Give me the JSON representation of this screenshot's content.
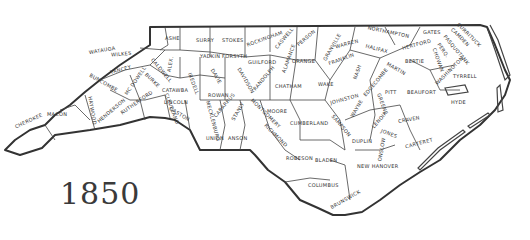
{
  "map": {
    "title_year": "1850",
    "region": "North Carolina",
    "counties": [
      {
        "id": "ashe",
        "name": "ASHE"
      },
      {
        "id": "surry",
        "name": "SURRY"
      },
      {
        "id": "stokes",
        "name": "STOKES"
      },
      {
        "id": "rockingham",
        "name": "ROCKINGHAM"
      },
      {
        "id": "caswell",
        "name": "CASWELL"
      },
      {
        "id": "person",
        "name": "PERSON"
      },
      {
        "id": "granville",
        "name": "GRANVILLE"
      },
      {
        "id": "warren",
        "name": "WARREN"
      },
      {
        "id": "northampton",
        "name": "NORTHAMPTON"
      },
      {
        "id": "gates",
        "name": "GATES"
      },
      {
        "id": "currituck",
        "name": "CURRITUCK"
      },
      {
        "id": "camden",
        "name": "CAMDEN"
      },
      {
        "id": "pasquotank",
        "name": "PASQUOTANK"
      },
      {
        "id": "perquimans",
        "name": "PERQ."
      },
      {
        "id": "chowan",
        "name": "CHOWAN"
      },
      {
        "id": "hertford",
        "name": "HERTFORD"
      },
      {
        "id": "bertie",
        "name": "BERTIE"
      },
      {
        "id": "halifax",
        "name": "HALIFAX"
      },
      {
        "id": "franklin",
        "name": "FRANKLIN"
      },
      {
        "id": "watauga",
        "name": "WATAUGA"
      },
      {
        "id": "wilkes",
        "name": "WILKES"
      },
      {
        "id": "yadkin",
        "name": "YADKIN"
      },
      {
        "id": "forsyth",
        "name": "FORSYTH"
      },
      {
        "id": "guilford",
        "name": "GUILFORD"
      },
      {
        "id": "alamance",
        "name": "ALAMANCE"
      },
      {
        "id": "orange",
        "name": "ORANGE"
      },
      {
        "id": "wake",
        "name": "WAKE"
      },
      {
        "id": "nash",
        "name": "NASH"
      },
      {
        "id": "edgecombe",
        "name": "EDGECOMBE"
      },
      {
        "id": "martin",
        "name": "MARTIN"
      },
      {
        "id": "washington",
        "name": "WASHINGTON"
      },
      {
        "id": "tyrrell",
        "name": "TYRRELL"
      },
      {
        "id": "yancey",
        "name": "YANCEY"
      },
      {
        "id": "caldwell",
        "name": "CALDWELL"
      },
      {
        "id": "alexander",
        "name": "ALEX."
      },
      {
        "id": "iredell",
        "name": "IREDELL"
      },
      {
        "id": "davie",
        "name": "DAVIE"
      },
      {
        "id": "davidson",
        "name": "DAVIDSON"
      },
      {
        "id": "randolph",
        "name": "RANDOLPH"
      },
      {
        "id": "chatham",
        "name": "CHATHAM"
      },
      {
        "id": "johnston",
        "name": "JOHNSTON"
      },
      {
        "id": "wayne",
        "name": "WAYNE"
      },
      {
        "id": "greene",
        "name": "GREENE"
      },
      {
        "id": "pitt",
        "name": "PITT"
      },
      {
        "id": "beaufort",
        "name": "BEAUFORT"
      },
      {
        "id": "hyde",
        "name": "HYDE"
      },
      {
        "id": "buncombe",
        "name": "BUNCOMBE"
      },
      {
        "id": "mcdowell",
        "name": "MC DOWELL"
      },
      {
        "id": "burke",
        "name": "BURKE"
      },
      {
        "id": "catawba",
        "name": "CATAWBA"
      },
      {
        "id": "lincoln",
        "name": "LINCOLN"
      },
      {
        "id": "rowan",
        "name": "ROWAN"
      },
      {
        "id": "cabarrus",
        "name": "CABARRUS"
      },
      {
        "id": "stanly",
        "name": "STANLY"
      },
      {
        "id": "montgomery",
        "name": "MONTGOMERY"
      },
      {
        "id": "moore",
        "name": "MOORE"
      },
      {
        "id": "cumberland",
        "name": "CUMBERLAND"
      },
      {
        "id": "sampson",
        "name": "SAMPSON"
      },
      {
        "id": "duplin",
        "name": "DUPLIN"
      },
      {
        "id": "lenoir",
        "name": "LENOIR"
      },
      {
        "id": "craven",
        "name": "CRAVEN"
      },
      {
        "id": "jones",
        "name": "JONES"
      },
      {
        "id": "carteret",
        "name": "CARTERET"
      },
      {
        "id": "onslow",
        "name": "ONSLOW"
      },
      {
        "id": "cherokee",
        "name": "CHEROKEE"
      },
      {
        "id": "macon",
        "name": "MACON"
      },
      {
        "id": "haywood",
        "name": "HAYWOOD"
      },
      {
        "id": "henderson",
        "name": "HENDERSON"
      },
      {
        "id": "rutherford",
        "name": "RUTHERFORD"
      },
      {
        "id": "cleveland",
        "name": "CLEVELAND"
      },
      {
        "id": "gaston",
        "name": "GASTON"
      },
      {
        "id": "mecklenburg",
        "name": "MECKLENBURG"
      },
      {
        "id": "union",
        "name": "UNION"
      },
      {
        "id": "anson",
        "name": "ANSON"
      },
      {
        "id": "richmond",
        "name": "RICHMOND"
      },
      {
        "id": "robeson",
        "name": "ROBESON"
      },
      {
        "id": "bladen",
        "name": "BLADEN"
      },
      {
        "id": "columbus",
        "name": "COLUMBUS"
      },
      {
        "id": "brunswick",
        "name": "BRUNSWICK"
      },
      {
        "id": "new_hanover",
        "name": "NEW HANOVER"
      }
    ]
  }
}
